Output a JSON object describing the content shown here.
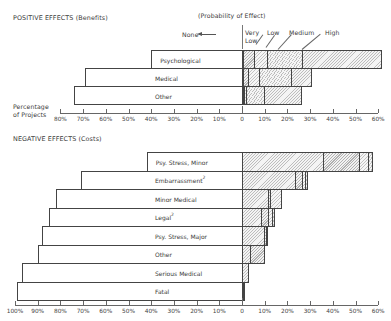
{
  "chart_data": [
    {
      "type": "bar",
      "title": "POSITIVE EFFECTS (Benefits)",
      "orientation": "horizontal-diverging-stacked",
      "legend_title": "(Probability of Effect)",
      "legend": [
        "None",
        "Very Low",
        "Low",
        "Medium",
        "High"
      ],
      "xlabel": "Percentage of Projects",
      "x_ticks_left": [
        "80%",
        "70%",
        "60%",
        "50%",
        "40%",
        "30%",
        "20%",
        "10%"
      ],
      "x_ticks_right": [
        "0",
        "10%",
        "20%",
        "30%",
        "40%",
        "50%",
        "60%"
      ],
      "xlim": [
        -80,
        60
      ],
      "categories": [
        "Psychological",
        "Medical",
        "Other"
      ],
      "series": [
        {
          "name": "None",
          "values": [
            40,
            69,
            74
          ]
        },
        {
          "name": "Very Low",
          "values": [
            0.5,
            1,
            1
          ]
        },
        {
          "name": "Low",
          "values": [
            5,
            5,
            1
          ]
        },
        {
          "name": "Medium",
          "values": [
            6,
            5,
            8
          ]
        },
        {
          "name": "High",
          "values": [
            15,
            14,
            16
          ]
        },
        {
          "name": "Highest (outer)",
          "values": [
            35,
            6,
            0
          ]
        }
      ]
    },
    {
      "type": "bar",
      "title": "NEGATIVE EFFECTS (Costs)",
      "orientation": "horizontal-diverging-stacked",
      "xlabel": "Percentage of Projects",
      "x_ticks_left": [
        "100%",
        "90%",
        "80%",
        "70%",
        "60%",
        "50%",
        "40%",
        "30%",
        "20%",
        "10%"
      ],
      "x_ticks_right": [
        "0",
        "10%",
        "20%",
        "30%",
        "40%",
        "50%",
        "60%"
      ],
      "xlim": [
        -100,
        60
      ],
      "categories": [
        "Psy. Stress, Minor",
        "Embarrassment",
        "Minor Medical",
        "Legal",
        "Psy. Stress, Major",
        "Other",
        "Serious Medical",
        "Fatal"
      ],
      "series": [
        {
          "name": "None",
          "values": [
            42,
            71,
            82,
            85,
            88,
            90,
            97,
            99
          ]
        },
        {
          "name": "Very Low",
          "values": [
            36,
            24,
            12,
            9,
            10,
            4,
            3,
            1
          ]
        },
        {
          "name": "Low",
          "values": [
            16,
            3,
            0.5,
            3,
            1,
            6,
            0,
            0.5
          ]
        },
        {
          "name": "Medium",
          "values": [
            4,
            1,
            5,
            1.5,
            0.5,
            0,
            0,
            0
          ]
        },
        {
          "name": "High",
          "values": [
            1.5,
            1,
            0,
            1,
            0,
            0,
            0,
            0
          ]
        }
      ]
    }
  ],
  "positive": {
    "title": "POSITIVE EFFECTS (Benefits)",
    "legend_title": "(Probability of Effect)",
    "legend_none": "None",
    "legend_very": "Very",
    "legend_low_sub": "Low",
    "legend_low": "Low",
    "legend_medium": "Medium",
    "legend_high": "High",
    "axis_label_1": "Percentage",
    "axis_label_2": "of Projects",
    "rows": [
      {
        "label": "Psychological",
        "none": 40,
        "segs": [
          0.5,
          5,
          6,
          15,
          35
        ]
      },
      {
        "label": "Medical",
        "none": 69,
        "segs": [
          1,
          2,
          5,
          14,
          9
        ]
      },
      {
        "label": "Other",
        "none": 74,
        "segs": [
          0.5,
          0.8,
          0.8,
          8,
          16
        ]
      }
    ]
  },
  "negative": {
    "title": "NEGATIVE EFFECTS (Costs)",
    "rows": [
      {
        "label": "Psy. Stress, Minor",
        "sup": "",
        "none": 42,
        "segs": [
          36,
          16,
          4,
          1.5
        ]
      },
      {
        "label": "Embarrassment",
        "sup": "2",
        "none": 71,
        "segs": [
          24,
          3,
          1,
          1
        ]
      },
      {
        "label": "Minor Medical",
        "sup": "",
        "none": 82,
        "segs": [
          12,
          0.6,
          5
        ]
      },
      {
        "label": "Legal",
        "sup": "2",
        "none": 85,
        "segs": [
          9,
          3,
          1.5,
          1
        ]
      },
      {
        "label": "Psy. Stress, Major",
        "sup": "",
        "none": 88,
        "segs": [
          10,
          1,
          0.6
        ]
      },
      {
        "label": "Other",
        "sup": "",
        "none": 90,
        "segs": [
          4,
          6
        ]
      },
      {
        "label": "Serious Medical",
        "sup": "",
        "none": 97,
        "segs": [
          3
        ]
      },
      {
        "label": "Fatal",
        "sup": "",
        "none": 99,
        "segs": [
          0.6,
          0.6
        ]
      }
    ]
  },
  "axes": {
    "top_left": [
      "80%",
      "70%",
      "60%",
      "50%",
      "40%",
      "30%",
      "20%",
      "10%"
    ],
    "top_right": [
      "0",
      "10%",
      "20%",
      "30%",
      "40%",
      "50%",
      "60%"
    ],
    "bottom_left": [
      "100%",
      "90%",
      "80%",
      "70%",
      "60%",
      "50%",
      "40%",
      "30%",
      "20%",
      "10%"
    ],
    "bottom_right": [
      "0",
      "10%",
      "20%",
      "30%",
      "40%",
      "50%",
      "60%"
    ]
  }
}
